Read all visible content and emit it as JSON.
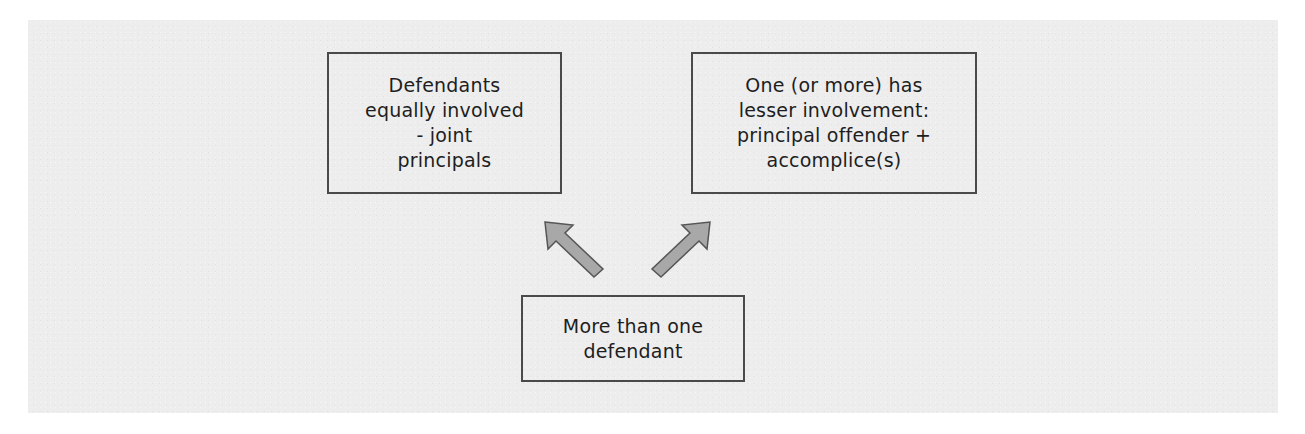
{
  "diagram": {
    "type": "flow",
    "background_color": "#ededed",
    "box_border_color": "#4a4a4a",
    "arrow_fill_color": "#a8a8a8",
    "arrow_stroke_color": "#555555",
    "nodes": {
      "left": {
        "lines": [
          "Defendants",
          "equally involved",
          "- joint",
          "principals"
        ]
      },
      "right": {
        "lines": [
          "One (or more) has",
          "lesser involvement:",
          "principal offender +",
          "accomplice(s)"
        ]
      },
      "bottom": {
        "lines": [
          "More than one",
          "defendant"
        ]
      }
    },
    "edges": [
      {
        "from": "bottom",
        "to": "left",
        "icon": "arrow-up-left-icon"
      },
      {
        "from": "bottom",
        "to": "right",
        "icon": "arrow-up-right-icon"
      }
    ]
  }
}
